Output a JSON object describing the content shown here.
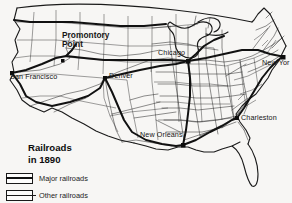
{
  "map": {
    "title_line1": "Railroads",
    "title_line2": "in 1890",
    "region": "United States",
    "background_color": "#f7f6f4",
    "line_color": "#1a1a1a",
    "legend": {
      "items": [
        {
          "label": "Major railroads",
          "swatch": "thick-line-in-box",
          "color": "#111111"
        },
        {
          "label": "Other railroads",
          "swatch": "thin-line-in-box",
          "color": "#1a1a1a"
        }
      ]
    },
    "points_of_interest": [
      {
        "name": "Promontory Point",
        "line1": "Promontory",
        "line2": "Point",
        "style": "bold",
        "x": 62,
        "y": 34
      }
    ],
    "cities": [
      {
        "name": "San Francisco",
        "label": "San Francisco",
        "x": 9,
        "y": 76,
        "marker_x": 12,
        "marker_y": 73
      },
      {
        "name": "Denver",
        "label": "Denver",
        "x": 110,
        "y": 75,
        "marker_x": 105,
        "marker_y": 78
      },
      {
        "name": "Chicago",
        "label": "Chicago",
        "x": 157,
        "y": 52,
        "marker_x": 188,
        "marker_y": 61
      },
      {
        "name": "New York",
        "label": "New Yor",
        "x": 261,
        "y": 60,
        "marker_x": 283,
        "marker_y": 57
      },
      {
        "name": "Charleston",
        "label": "Charleston",
        "x": 240,
        "y": 117,
        "marker_x": 237,
        "marker_y": 118
      },
      {
        "name": "New Orleans",
        "label": "New Orleans",
        "x": 139,
        "y": 134,
        "marker_x": 183,
        "marker_y": 145
      }
    ]
  }
}
